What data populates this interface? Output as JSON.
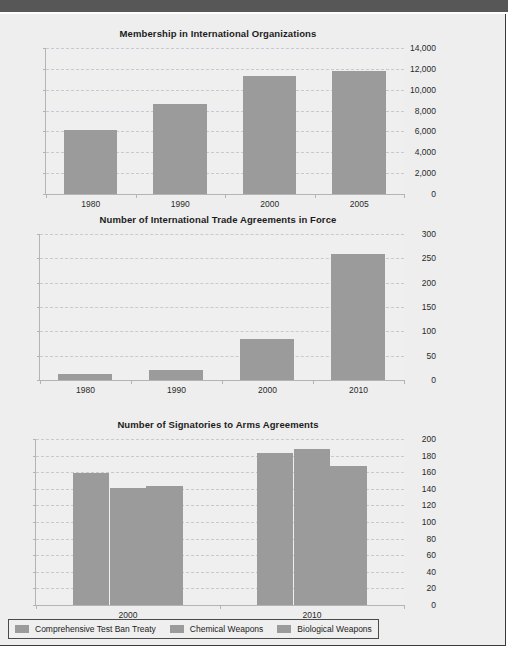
{
  "page": {
    "background_color": "#eeeeee",
    "top_bar_color": "#575757",
    "bar_color": "#9b9b9b",
    "gridline_color": "#c9c9d6"
  },
  "legend": {
    "items": [
      {
        "label": "Comprehensive Test Ban Treaty",
        "color": "#9b9b9b"
      },
      {
        "label": "Chemical Weapons",
        "color": "#9b9b9b"
      },
      {
        "label": "Biological Weapons",
        "color": "#9b9b9b"
      }
    ]
  },
  "chart_data": [
    {
      "type": "bar",
      "title": "Membership in International Organizations",
      "xlabel": "",
      "ylabel": "",
      "categories": [
        "1980",
        "1990",
        "2000",
        "2005"
      ],
      "values": [
        6100,
        8650,
        11300,
        11800
      ],
      "ylim": [
        0,
        14000
      ],
      "yticks": [
        0,
        2000,
        4000,
        6000,
        8000,
        10000,
        12000,
        14000
      ],
      "ytick_labels": [
        "0",
        "2,000",
        "4,000",
        "6,000",
        "8,000",
        "10,000",
        "12,000",
        "14,000"
      ],
      "grid": true,
      "legend_position": "none"
    },
    {
      "type": "bar",
      "title": "Number of International Trade Agreements in Force",
      "xlabel": "",
      "ylabel": "",
      "categories": [
        "1980",
        "1990",
        "2000",
        "2010"
      ],
      "values": [
        12,
        20,
        85,
        258
      ],
      "ylim": [
        0,
        300
      ],
      "yticks": [
        0,
        50,
        100,
        150,
        200,
        250,
        300
      ],
      "ytick_labels": [
        "0",
        "50",
        "100",
        "150",
        "200",
        "250",
        "300"
      ],
      "grid": true,
      "legend_position": "none"
    },
    {
      "type": "bar",
      "title": "Number of Signatories to Arms Agreements",
      "xlabel": "",
      "ylabel": "",
      "categories": [
        "2000",
        "2010"
      ],
      "series": [
        {
          "name": "Comprehensive Test Ban Treaty",
          "values": [
            159,
            183
          ]
        },
        {
          "name": "Chemical Weapons",
          "values": [
            141,
            188
          ]
        },
        {
          "name": "Biological Weapons",
          "values": [
            143,
            168
          ]
        }
      ],
      "ylim": [
        0,
        200
      ],
      "yticks": [
        0,
        20,
        40,
        60,
        80,
        100,
        120,
        140,
        160,
        180,
        200
      ],
      "ytick_labels": [
        "0",
        "20",
        "40",
        "60",
        "80",
        "100",
        "120",
        "140",
        "160",
        "180",
        "200"
      ],
      "grid": true,
      "legend_position": "bottom"
    }
  ]
}
